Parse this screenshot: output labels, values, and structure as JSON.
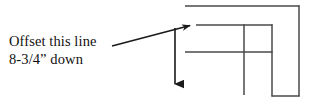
{
  "figure": {
    "type": "technical-drawing-annotation",
    "background_color": "#ffffff",
    "line_color": "#4a4a4a",
    "arrow_color": "#1a1a1a",
    "text_color": "#111111",
    "annotation": {
      "line_1": "Offset this line",
      "line_2": "8-3/4” down",
      "full_text": "Offset this line 8-3/4” down"
    },
    "callout": {
      "name": "leader-arrow",
      "from": [
        112,
        46
      ],
      "to": [
        196,
        24
      ],
      "direction": "up-right",
      "points_at": "upper-left-corner-of-inner-profile"
    },
    "offset_arrow": {
      "name": "downward-offset-arrow",
      "from": [
        175,
        28
      ],
      "to": [
        175,
        93
      ],
      "direction": "down",
      "meaning": "offset distance downward"
    },
    "geometry": {
      "description": "L-shaped / stepped outline profile drawn with thin rules",
      "segments": [
        {
          "name": "outer-top-rule",
          "x1": 185,
          "y1": 6,
          "x2": 299,
          "y2": 6,
          "orientation": "horizontal"
        },
        {
          "name": "outer-right-rule",
          "x1": 299,
          "y1": 6,
          "x2": 299,
          "y2": 96,
          "orientation": "vertical"
        },
        {
          "name": "outer-bottom-rule",
          "x1": 272,
          "y1": 96,
          "x2": 299,
          "y2": 96,
          "orientation": "horizontal"
        },
        {
          "name": "inner-top-rule",
          "x1": 196,
          "y1": 25,
          "x2": 272,
          "y2": 25,
          "orientation": "horizontal"
        },
        {
          "name": "inner-middle-rule",
          "x1": 185,
          "y1": 52,
          "x2": 272,
          "y2": 52,
          "orientation": "horizontal"
        },
        {
          "name": "inner-right-rule",
          "x1": 272,
          "y1": 25,
          "x2": 272,
          "y2": 96,
          "orientation": "vertical"
        },
        {
          "name": "inner-left-rule",
          "x1": 244,
          "y1": 25,
          "x2": 244,
          "y2": 95,
          "orientation": "vertical"
        }
      ]
    }
  }
}
